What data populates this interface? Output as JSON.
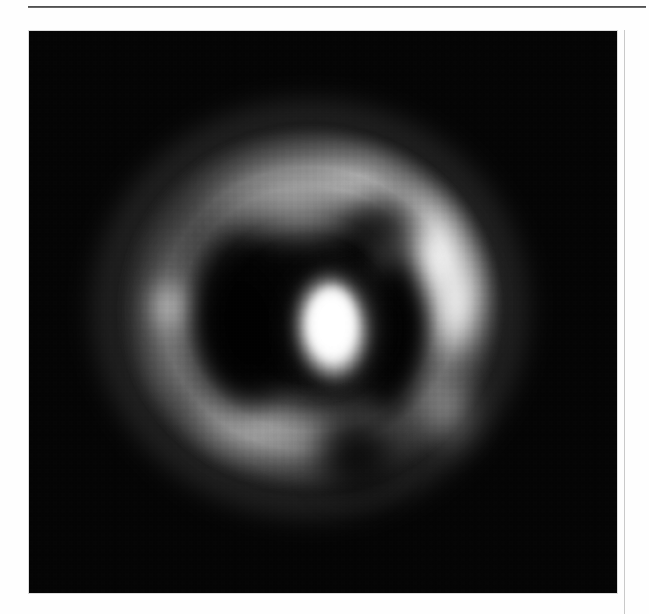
{
  "page": {
    "background_color": "#fdfdfd",
    "rule_color": "#3a3a3a",
    "column_rule_color": "#c9c9c9"
  },
  "figure": {
    "name": "grayscale-tomographic-image",
    "background_color": "#000000",
    "frame": {
      "x": 29,
      "y": 31,
      "width": 588,
      "height": 562
    },
    "caption": "",
    "label": ""
  },
  "chart_data": {
    "type": "heatmap",
    "title": "",
    "subtitle": "",
    "xlabel": "",
    "ylabel": "",
    "colormap": "grayscale",
    "background": "#000000",
    "value_range": [
      0,
      255
    ],
    "grid": false,
    "legend": "none",
    "features": [
      {
        "name": "outer-ring",
        "kind": "annulus",
        "center": [
          320,
          305
        ],
        "outer_radius_x": 195,
        "outer_radius_y": 186,
        "inner_radius_x": 120,
        "inner_radius_y": 112,
        "peak_intensity": 255,
        "mean_intensity": 120
      },
      {
        "name": "bright-arc-upper-right",
        "kind": "arc",
        "center": [
          434,
          243
        ],
        "angle_start_deg": 12,
        "angle_end_deg": 78,
        "peak_intensity": 255
      },
      {
        "name": "bright-arc-right",
        "kind": "arc",
        "center": [
          462,
          326
        ],
        "angle_start_deg": -20,
        "angle_end_deg": 20,
        "peak_intensity": 248
      },
      {
        "name": "hotspot-left-limb",
        "kind": "blob",
        "center": [
          169,
          306
        ],
        "radius_x": 36,
        "radius_y": 45,
        "peak_intensity": 205
      },
      {
        "name": "dim-arc-top",
        "kind": "arc",
        "center": [
          294,
          190
        ],
        "angle_start_deg": 100,
        "angle_end_deg": 160,
        "peak_intensity": 165
      },
      {
        "name": "arc-bottom-left",
        "kind": "arc",
        "center": [
          251,
          429
        ],
        "angle_start_deg": 200,
        "angle_end_deg": 260,
        "peak_intensity": 185
      },
      {
        "name": "central-core",
        "kind": "blob",
        "center": [
          322,
          330
        ],
        "radius_x": 42,
        "radius_y": 61,
        "peak_intensity": 255
      },
      {
        "name": "dark-lobe-left",
        "kind": "void",
        "center": [
          243,
          332
        ],
        "radius_x": 56,
        "radius_y": 95,
        "peak_intensity": 6
      },
      {
        "name": "dark-lobe-right",
        "kind": "void",
        "center": [
          393,
          330
        ],
        "radius_x": 38,
        "radius_y": 103,
        "peak_intensity": 8
      },
      {
        "name": "dark-notch-bottom",
        "kind": "void",
        "center": [
          356,
          464
        ],
        "radius_x": 55,
        "radius_y": 55,
        "peak_intensity": 10
      }
    ]
  }
}
